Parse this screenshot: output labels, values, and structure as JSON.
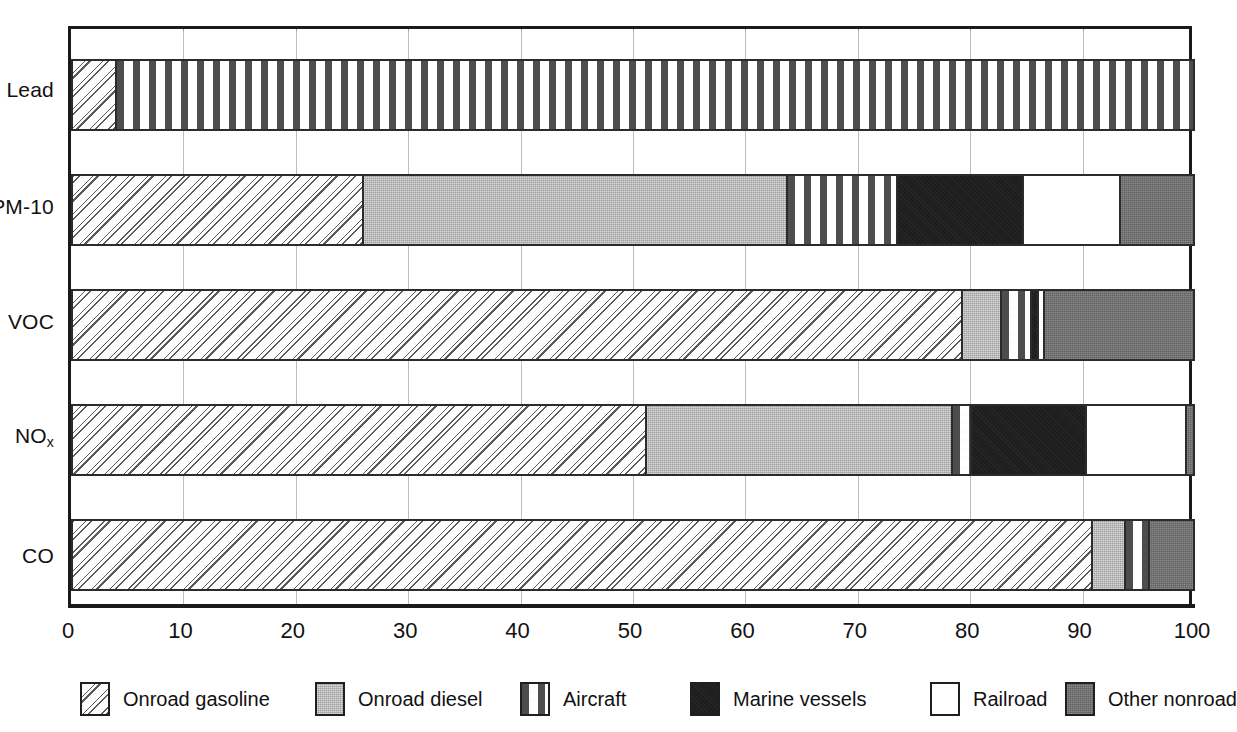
{
  "chart_data": {
    "type": "bar",
    "orientation": "horizontal",
    "stacked": true,
    "normalized_percent": true,
    "title": "",
    "subtitle": "",
    "xlabel": "",
    "ylabel": "",
    "xlim": [
      0,
      100
    ],
    "xticks": [
      0,
      10,
      20,
      30,
      40,
      50,
      60,
      70,
      80,
      90,
      100
    ],
    "xtick_labels": [
      "0",
      "10",
      "20",
      "30",
      "40",
      "50",
      "60",
      "70",
      "80",
      "90",
      "100"
    ],
    "grid": "vertical-dotted",
    "legend_position": "bottom",
    "categories": [
      "Lead",
      "PM-10",
      "VOC",
      "NOx",
      "CO"
    ],
    "category_labels": [
      "Lead",
      "PM-10",
      "VOC",
      "NO",
      "CO"
    ],
    "series": [
      {
        "name": "Onroad gasoline",
        "pattern": "diagonal-dotted-lines",
        "color": "#fdfdfd",
        "values": [
          4,
          26,
          79,
          51,
          91
        ]
      },
      {
        "name": "Onroad diesel",
        "pattern": "solid-light-gray",
        "color": "#b2b2b2",
        "values": [
          0,
          38,
          3,
          27,
          3
        ]
      },
      {
        "name": "Aircraft",
        "pattern": "horizontal-dashes",
        "color": "#fdfdfd",
        "values": [
          96,
          10,
          3,
          2,
          2
        ]
      },
      {
        "name": "Marine vessels",
        "pattern": "solid-black",
        "color": "#1d1d1d",
        "values": [
          0,
          11,
          1,
          10,
          0
        ]
      },
      {
        "name": "Railroad",
        "pattern": "white-empty",
        "color": "#ffffff",
        "values": [
          0,
          9,
          1,
          9,
          0
        ]
      },
      {
        "name": "Other nonroad",
        "pattern": "solid-dark-gray",
        "color": "#6e6e6e",
        "values": [
          0,
          6,
          13,
          1,
          4
        ]
      }
    ],
    "segment_boundaries_percent": {
      "Lead": [
        [
          0,
          4
        ],
        [
          4,
          4
        ],
        [
          4,
          100
        ],
        [
          100,
          100
        ],
        [
          100,
          100
        ],
        [
          100,
          100
        ]
      ],
      "PM-10": [
        [
          0,
          26
        ],
        [
          26,
          63.7
        ],
        [
          63.7,
          73.5
        ],
        [
          73.5,
          84.7
        ],
        [
          84.7,
          93.3
        ],
        [
          93.3,
          100
        ]
      ],
      "VOC": [
        [
          0,
          79.3
        ],
        [
          79.3,
          82.7
        ],
        [
          82.7,
          85.4
        ],
        [
          85.4,
          86.0
        ],
        [
          86.0,
          86.6
        ],
        [
          86.6,
          100
        ]
      ],
      "NOx": [
        [
          0,
          51.2
        ],
        [
          51.2,
          78.4
        ],
        [
          78.4,
          80.1
        ],
        [
          80.1,
          90.3
        ],
        [
          90.3,
          99.2
        ],
        [
          99.2,
          100
        ]
      ],
      "CO": [
        [
          0,
          90.8
        ],
        [
          90.8,
          93.8
        ],
        [
          93.8,
          95.9
        ],
        [
          95.9,
          95.9
        ],
        [
          95.9,
          95.9
        ],
        [
          95.9,
          100
        ]
      ]
    }
  },
  "legend": {
    "items": [
      {
        "label": "Onroad gasoline",
        "swatch": "onroad-gasoline"
      },
      {
        "label": "Onroad diesel",
        "swatch": "onroad-diesel"
      },
      {
        "label": "Aircraft",
        "swatch": "aircraft"
      },
      {
        "label": "Marine vessels",
        "swatch": "marine-vessels"
      },
      {
        "label": "Railroad",
        "swatch": "railroad"
      },
      {
        "label": "Other nonroad",
        "swatch": "other-nonroad"
      }
    ]
  },
  "axis": {
    "tick_labels": [
      "0",
      "10",
      "20",
      "30",
      "40",
      "50",
      "60",
      "70",
      "80",
      "90",
      "100"
    ]
  },
  "categories": {
    "lead": "Lead",
    "pm10": "PM-10",
    "voc": "VOC",
    "nox_base": "NO",
    "nox_sub": "x",
    "co": "CO"
  }
}
